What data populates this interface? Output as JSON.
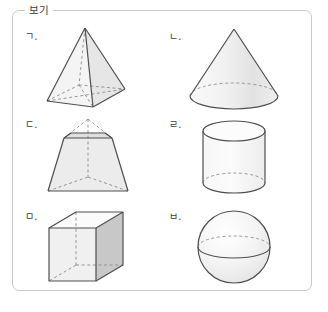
{
  "panel": {
    "tab_label": "보기",
    "border_color": "#c9c9c9",
    "background_color": "#ffffff"
  },
  "palette": {
    "stroke": "#555555",
    "dashed_stroke": "#8c8c8c",
    "face_light": "#f2f2f2",
    "face_mid": "#e2e2e2",
    "face_dark": "#c8c8c8",
    "face_top": "#fbfbfb",
    "text": "#3c3c3c"
  },
  "items": [
    {
      "label": "ㄱ.",
      "name": "square-pyramid",
      "shape": "square pyramid",
      "row": 0,
      "column": 0
    },
    {
      "label": "ㄴ.",
      "name": "cone",
      "shape": "cone",
      "row": 0,
      "column": 1
    },
    {
      "label": "ㄷ.",
      "name": "truncated-pyramid",
      "shape": "truncated square pyramid (frustum)",
      "row": 1,
      "column": 0
    },
    {
      "label": "ㄹ.",
      "name": "cylinder",
      "shape": "cylinder",
      "row": 1,
      "column": 1
    },
    {
      "label": "ㅁ.",
      "name": "cube",
      "shape": "cube",
      "row": 2,
      "column": 0
    },
    {
      "label": "ㅂ.",
      "name": "sphere",
      "shape": "sphere",
      "row": 2,
      "column": 1
    }
  ]
}
